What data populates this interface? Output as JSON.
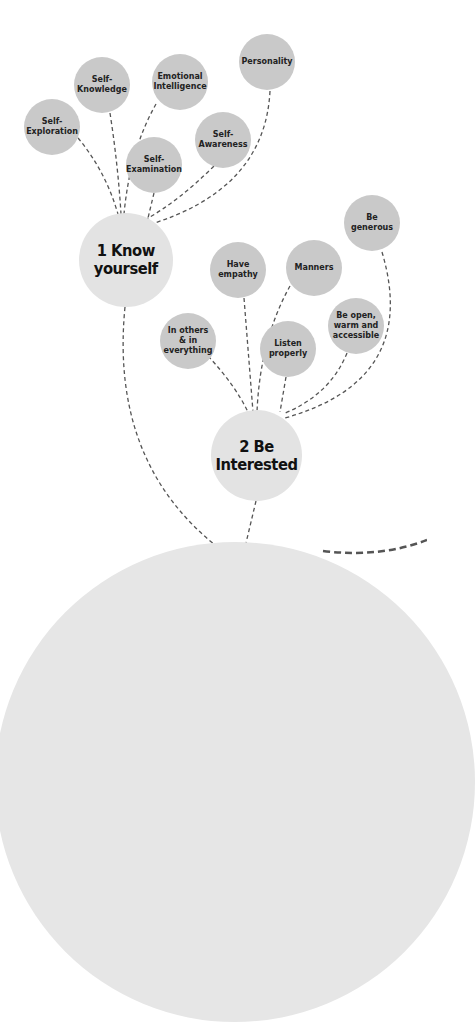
{
  "diagram": {
    "colors": {
      "leaf": "#c9c9c9",
      "hub": "#e3e3e3",
      "base": "#e6e6e6",
      "link": "#555555",
      "text": "#222222"
    },
    "hubs": [
      {
        "id": "know-yourself",
        "label": "1 Know\nyourself"
      },
      {
        "id": "be-interested",
        "label": "2 Be\nInterested"
      }
    ],
    "know_yourself_children": [
      {
        "label": "Self-\nExploration"
      },
      {
        "label": "Self-\nKnowledge"
      },
      {
        "label": "Emotional\nIntelligence"
      },
      {
        "label": "Personality"
      },
      {
        "label": "Self-\nAwareness"
      },
      {
        "label": "Self-\nExamination"
      }
    ],
    "be_interested_children": [
      {
        "label": "Have\nempathy"
      },
      {
        "label": "Manners"
      },
      {
        "label": "Be\ngenerous"
      },
      {
        "label": "In others\n& in\neverything"
      },
      {
        "label": "Listen\nproperly"
      },
      {
        "label": "Be open,\nwarm and\naccessible"
      }
    ]
  }
}
